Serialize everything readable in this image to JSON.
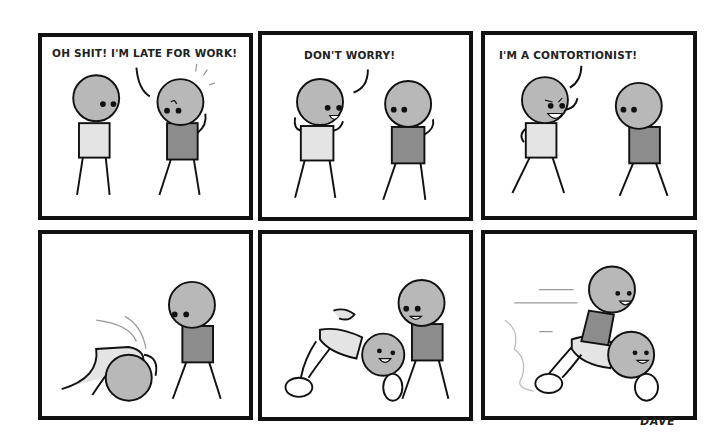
{
  "comic": {
    "artist_signature": "DAVE",
    "colors": {
      "head": "#b8b8b8",
      "shirt_light": "#e4e4e4",
      "shirt_dark": "#8c8c8c",
      "ink": "#111111"
    },
    "panels": [
      {
        "index": 1,
        "dialogue": "OH SHIT! I'M LATE FOR WORK!",
        "scene": "Two stick figures standing; the one in the dark shirt looks worried."
      },
      {
        "index": 2,
        "dialogue": "DON'T WORRY!",
        "scene": "Light-shirt figure reassures the worried dark-shirt figure."
      },
      {
        "index": 3,
        "dialogue": "I'M A CONTORTIONIST!",
        "scene": "Light-shirt figure grins with a mischievous look."
      },
      {
        "index": 4,
        "dialogue": "",
        "scene": "Light-shirt figure contorts his body into a ball on the ground."
      },
      {
        "index": 5,
        "dialogue": "",
        "scene": "Contorted figure forms a bike-like shape, smiling; other figure watches."
      },
      {
        "index": 6,
        "dialogue": "",
        "scene": "Dark-shirt figure rides the contorted figure like a bike, speeding off."
      }
    ]
  }
}
